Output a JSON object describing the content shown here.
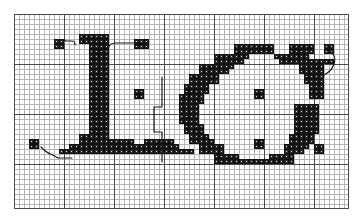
{
  "document": {
    "type": "cross-stitch-chart",
    "title": "Cross-stitch alphabet chart: L and G",
    "description": "Two-letter counted cross-stitch pattern chart on a squared grid with backstitch detail lines."
  },
  "grid": {
    "columns": 67,
    "rows": 39,
    "cell_size_px": 5,
    "bold_line_every": 10,
    "fine_line_color": "#b4b4b4",
    "bold_line_color": "#4a4a4a",
    "background_color": "#ffffff",
    "border_color": "#4a4a4a",
    "origin_x_px": 14,
    "origin_y_px": 14,
    "width_px": 335,
    "height_px": 195
  },
  "symbols": {
    "stitch": {
      "name": "full-cross-stitch",
      "fill_color": "#2b2b2b",
      "outline_color": "#111111",
      "center_dot_color": "#dcdcdc"
    },
    "backstitch": {
      "name": "backstitch-line",
      "stroke_color": "#1a1a1a",
      "stroke_width": 1.2
    }
  },
  "letters": [
    {
      "name": "letter-L",
      "character": "L",
      "position": "left"
    },
    {
      "name": "letter-G",
      "character": "G",
      "position": "right"
    }
  ],
  "chart_data": {
    "type": "heatmap",
    "xlabel": "",
    "ylabel": "",
    "grid": true,
    "legend": "none",
    "columns": 67,
    "rows": 39,
    "note": "Each entry is a filled cell given as [column, row], zero-indexed from the top-left of the charted field.",
    "stitches": [
      [
        8,
        5
      ],
      [
        9,
        5
      ],
      [
        8,
        6
      ],
      [
        9,
        6
      ],
      [
        13,
        4
      ],
      [
        14,
        4
      ],
      [
        15,
        4
      ],
      [
        16,
        4
      ],
      [
        17,
        4
      ],
      [
        18,
        4
      ],
      [
        13,
        5
      ],
      [
        14,
        5
      ],
      [
        15,
        5
      ],
      [
        16,
        5
      ],
      [
        17,
        5
      ],
      [
        18,
        5
      ],
      [
        15,
        6
      ],
      [
        16,
        6
      ],
      [
        17,
        6
      ],
      [
        18,
        6
      ],
      [
        24,
        5
      ],
      [
        25,
        5
      ],
      [
        26,
        5
      ],
      [
        24,
        6
      ],
      [
        25,
        6
      ],
      [
        26,
        6
      ],
      [
        15,
        7
      ],
      [
        16,
        7
      ],
      [
        17,
        7
      ],
      [
        18,
        7
      ],
      [
        15,
        8
      ],
      [
        16,
        8
      ],
      [
        17,
        8
      ],
      [
        18,
        8
      ],
      [
        15,
        9
      ],
      [
        16,
        9
      ],
      [
        17,
        9
      ],
      [
        18,
        9
      ],
      [
        15,
        10
      ],
      [
        16,
        10
      ],
      [
        17,
        10
      ],
      [
        18,
        10
      ],
      [
        15,
        11
      ],
      [
        16,
        11
      ],
      [
        17,
        11
      ],
      [
        18,
        11
      ],
      [
        15,
        12
      ],
      [
        16,
        12
      ],
      [
        17,
        12
      ],
      [
        18,
        12
      ],
      [
        15,
        13
      ],
      [
        16,
        13
      ],
      [
        17,
        13
      ],
      [
        18,
        13
      ],
      [
        15,
        14
      ],
      [
        16,
        14
      ],
      [
        17,
        14
      ],
      [
        18,
        14
      ],
      [
        15,
        15
      ],
      [
        16,
        15
      ],
      [
        17,
        15
      ],
      [
        18,
        15
      ],
      [
        15,
        16
      ],
      [
        16,
        16
      ],
      [
        17,
        16
      ],
      [
        18,
        16
      ],
      [
        15,
        17
      ],
      [
        16,
        17
      ],
      [
        17,
        17
      ],
      [
        18,
        17
      ],
      [
        15,
        18
      ],
      [
        16,
        18
      ],
      [
        17,
        18
      ],
      [
        18,
        18
      ],
      [
        15,
        19
      ],
      [
        16,
        19
      ],
      [
        17,
        19
      ],
      [
        18,
        19
      ],
      [
        15,
        20
      ],
      [
        16,
        20
      ],
      [
        17,
        20
      ],
      [
        18,
        20
      ],
      [
        15,
        21
      ],
      [
        16,
        21
      ],
      [
        17,
        21
      ],
      [
        18,
        21
      ],
      [
        15,
        22
      ],
      [
        16,
        22
      ],
      [
        17,
        22
      ],
      [
        18,
        22
      ],
      [
        15,
        23
      ],
      [
        16,
        23
      ],
      [
        17,
        23
      ],
      [
        18,
        23
      ],
      [
        24,
        15
      ],
      [
        25,
        15
      ],
      [
        24,
        16
      ],
      [
        25,
        16
      ],
      [
        13,
        24
      ],
      [
        14,
        24
      ],
      [
        15,
        24
      ],
      [
        16,
        24
      ],
      [
        17,
        24
      ],
      [
        18,
        24
      ],
      [
        13,
        25
      ],
      [
        14,
        25
      ],
      [
        15,
        25
      ],
      [
        16,
        25
      ],
      [
        17,
        25
      ],
      [
        18,
        25
      ],
      [
        19,
        25
      ],
      [
        20,
        25
      ],
      [
        21,
        25
      ],
      [
        22,
        25
      ],
      [
        23,
        25
      ],
      [
        11,
        26
      ],
      [
        12,
        26
      ],
      [
        13,
        26
      ],
      [
        14,
        26
      ],
      [
        15,
        26
      ],
      [
        16,
        26
      ],
      [
        17,
        26
      ],
      [
        18,
        26
      ],
      [
        19,
        26
      ],
      [
        20,
        26
      ],
      [
        21,
        26
      ],
      [
        22,
        26
      ],
      [
        23,
        26
      ],
      [
        24,
        26
      ],
      [
        25,
        26
      ],
      [
        26,
        25
      ],
      [
        27,
        25
      ],
      [
        28,
        25
      ],
      [
        29,
        25
      ],
      [
        30,
        25
      ],
      [
        31,
        25
      ],
      [
        26,
        26
      ],
      [
        27,
        26
      ],
      [
        28,
        26
      ],
      [
        29,
        26
      ],
      [
        30,
        26
      ],
      [
        31,
        26
      ],
      [
        32,
        26
      ],
      [
        9,
        27
      ],
      [
        10,
        27
      ],
      [
        11,
        27
      ],
      [
        12,
        27
      ],
      [
        13,
        27
      ],
      [
        14,
        27
      ],
      [
        15,
        27
      ],
      [
        16,
        27
      ],
      [
        17,
        27
      ],
      [
        18,
        27
      ],
      [
        19,
        27
      ],
      [
        20,
        27
      ],
      [
        21,
        27
      ],
      [
        22,
        27
      ],
      [
        23,
        27
      ],
      [
        24,
        27
      ],
      [
        25,
        27
      ],
      [
        26,
        27
      ],
      [
        27,
        27
      ],
      [
        28,
        27
      ],
      [
        29,
        27
      ],
      [
        30,
        27
      ],
      [
        31,
        27
      ],
      [
        32,
        27
      ],
      [
        33,
        27
      ],
      [
        34,
        27
      ],
      [
        35,
        27
      ],
      [
        3,
        25
      ],
      [
        4,
        25
      ],
      [
        3,
        26
      ],
      [
        4,
        26
      ],
      [
        39,
        26
      ],
      [
        40,
        26
      ],
      [
        39,
        27
      ],
      [
        40,
        27
      ],
      [
        44,
        6
      ],
      [
        45,
        6
      ],
      [
        46,
        6
      ],
      [
        47,
        6
      ],
      [
        48,
        6
      ],
      [
        49,
        6
      ],
      [
        50,
        6
      ],
      [
        51,
        6
      ],
      [
        44,
        7
      ],
      [
        45,
        7
      ],
      [
        46,
        7
      ],
      [
        47,
        7
      ],
      [
        48,
        7
      ],
      [
        49,
        7
      ],
      [
        50,
        7
      ],
      [
        51,
        7
      ],
      [
        55,
        6
      ],
      [
        56,
        6
      ],
      [
        57,
        6
      ],
      [
        58,
        6
      ],
      [
        59,
        6
      ],
      [
        55,
        7
      ],
      [
        56,
        7
      ],
      [
        57,
        7
      ],
      [
        58,
        7
      ],
      [
        59,
        7
      ],
      [
        62,
        6
      ],
      [
        63,
        6
      ],
      [
        62,
        7
      ],
      [
        63,
        7
      ],
      [
        40,
        8
      ],
      [
        41,
        8
      ],
      [
        42,
        8
      ],
      [
        43,
        8
      ],
      [
        44,
        8
      ],
      [
        45,
        8
      ],
      [
        46,
        8
      ],
      [
        40,
        9
      ],
      [
        41,
        9
      ],
      [
        42,
        9
      ],
      [
        43,
        9
      ],
      [
        44,
        9
      ],
      [
        45,
        9
      ],
      [
        52,
        8
      ],
      [
        53,
        8
      ],
      [
        54,
        8
      ],
      [
        55,
        8
      ],
      [
        56,
        8
      ],
      [
        57,
        8
      ],
      [
        58,
        8
      ],
      [
        53,
        9
      ],
      [
        54,
        9
      ],
      [
        55,
        9
      ],
      [
        56,
        9
      ],
      [
        57,
        9
      ],
      [
        58,
        9
      ],
      [
        59,
        9
      ],
      [
        60,
        9
      ],
      [
        61,
        9
      ],
      [
        62,
        9
      ],
      [
        63,
        9
      ],
      [
        37,
        10
      ],
      [
        38,
        10
      ],
      [
        39,
        10
      ],
      [
        40,
        10
      ],
      [
        41,
        10
      ],
      [
        42,
        10
      ],
      [
        43,
        10
      ],
      [
        37,
        11
      ],
      [
        38,
        11
      ],
      [
        39,
        11
      ],
      [
        40,
        11
      ],
      [
        41,
        11
      ],
      [
        42,
        11
      ],
      [
        57,
        10
      ],
      [
        58,
        10
      ],
      [
        59,
        10
      ],
      [
        60,
        10
      ],
      [
        61,
        10
      ],
      [
        57,
        11
      ],
      [
        58,
        11
      ],
      [
        59,
        11
      ],
      [
        60,
        11
      ],
      [
        61,
        11
      ],
      [
        35,
        12
      ],
      [
        36,
        12
      ],
      [
        37,
        12
      ],
      [
        38,
        12
      ],
      [
        39,
        12
      ],
      [
        40,
        12
      ],
      [
        35,
        13
      ],
      [
        36,
        13
      ],
      [
        37,
        13
      ],
      [
        38,
        13
      ],
      [
        39,
        13
      ],
      [
        40,
        13
      ],
      [
        58,
        12
      ],
      [
        59,
        12
      ],
      [
        60,
        12
      ],
      [
        61,
        12
      ],
      [
        58,
        13
      ],
      [
        59,
        13
      ],
      [
        60,
        13
      ],
      [
        61,
        13
      ],
      [
        34,
        14
      ],
      [
        35,
        14
      ],
      [
        36,
        14
      ],
      [
        37,
        14
      ],
      [
        38,
        14
      ],
      [
        34,
        15
      ],
      [
        35,
        15
      ],
      [
        36,
        15
      ],
      [
        37,
        15
      ],
      [
        38,
        15
      ],
      [
        59,
        14
      ],
      [
        60,
        14
      ],
      [
        61,
        14
      ],
      [
        59,
        15
      ],
      [
        60,
        15
      ],
      [
        61,
        15
      ],
      [
        33,
        16
      ],
      [
        34,
        16
      ],
      [
        35,
        16
      ],
      [
        36,
        16
      ],
      [
        37,
        16
      ],
      [
        33,
        17
      ],
      [
        34,
        17
      ],
      [
        35,
        17
      ],
      [
        36,
        17
      ],
      [
        37,
        17
      ],
      [
        59,
        16
      ],
      [
        60,
        16
      ],
      [
        61,
        16
      ],
      [
        48,
        15
      ],
      [
        49,
        15
      ],
      [
        48,
        16
      ],
      [
        49,
        16
      ],
      [
        33,
        18
      ],
      [
        34,
        18
      ],
      [
        35,
        18
      ],
      [
        36,
        18
      ],
      [
        33,
        19
      ],
      [
        34,
        19
      ],
      [
        35,
        19
      ],
      [
        36,
        19
      ],
      [
        33,
        20
      ],
      [
        34,
        20
      ],
      [
        35,
        20
      ],
      [
        36,
        20
      ],
      [
        33,
        21
      ],
      [
        34,
        21
      ],
      [
        35,
        21
      ],
      [
        36,
        21
      ],
      [
        56,
        18
      ],
      [
        57,
        18
      ],
      [
        58,
        18
      ],
      [
        59,
        18
      ],
      [
        60,
        18
      ],
      [
        56,
        19
      ],
      [
        57,
        19
      ],
      [
        58,
        19
      ],
      [
        59,
        19
      ],
      [
        60,
        19
      ],
      [
        56,
        20
      ],
      [
        57,
        20
      ],
      [
        58,
        20
      ],
      [
        59,
        20
      ],
      [
        60,
        20
      ],
      [
        56,
        21
      ],
      [
        57,
        21
      ],
      [
        58,
        21
      ],
      [
        59,
        21
      ],
      [
        60,
        21
      ],
      [
        34,
        22
      ],
      [
        35,
        22
      ],
      [
        36,
        22
      ],
      [
        37,
        22
      ],
      [
        34,
        23
      ],
      [
        35,
        23
      ],
      [
        36,
        23
      ],
      [
        37,
        23
      ],
      [
        56,
        22
      ],
      [
        57,
        22
      ],
      [
        58,
        22
      ],
      [
        59,
        22
      ],
      [
        60,
        22
      ],
      [
        56,
        23
      ],
      [
        57,
        23
      ],
      [
        58,
        23
      ],
      [
        59,
        23
      ],
      [
        60,
        23
      ],
      [
        48,
        25
      ],
      [
        49,
        25
      ],
      [
        48,
        26
      ],
      [
        49,
        26
      ],
      [
        35,
        24
      ],
      [
        36,
        24
      ],
      [
        37,
        24
      ],
      [
        38,
        24
      ],
      [
        35,
        25
      ],
      [
        36,
        25
      ],
      [
        37,
        25
      ],
      [
        38,
        25
      ],
      [
        39,
        25
      ],
      [
        55,
        24
      ],
      [
        56,
        24
      ],
      [
        57,
        24
      ],
      [
        58,
        24
      ],
      [
        59,
        24
      ],
      [
        55,
        25
      ],
      [
        56,
        25
      ],
      [
        57,
        25
      ],
      [
        58,
        25
      ],
      [
        59,
        25
      ],
      [
        37,
        26
      ],
      [
        38,
        26
      ],
      [
        39,
        26
      ],
      [
        40,
        26
      ],
      [
        41,
        26
      ],
      [
        37,
        27
      ],
      [
        38,
        27
      ],
      [
        39,
        27
      ],
      [
        40,
        27
      ],
      [
        41,
        27
      ],
      [
        54,
        26
      ],
      [
        55,
        26
      ],
      [
        56,
        26
      ],
      [
        57,
        26
      ],
      [
        58,
        26
      ],
      [
        54,
        27
      ],
      [
        55,
        27
      ],
      [
        56,
        27
      ],
      [
        57,
        27
      ],
      [
        60,
        26
      ],
      [
        61,
        26
      ],
      [
        60,
        27
      ],
      [
        61,
        27
      ],
      [
        40,
        28
      ],
      [
        41,
        28
      ],
      [
        42,
        28
      ],
      [
        43,
        28
      ],
      [
        44,
        28
      ],
      [
        40,
        29
      ],
      [
        41,
        29
      ],
      [
        42,
        29
      ],
      [
        43,
        29
      ],
      [
        44,
        29
      ],
      [
        45,
        29
      ],
      [
        46,
        29
      ],
      [
        47,
        29
      ],
      [
        48,
        29
      ],
      [
        49,
        29
      ],
      [
        50,
        29
      ],
      [
        51,
        29
      ],
      [
        52,
        29
      ],
      [
        53,
        29
      ],
      [
        54,
        29
      ],
      [
        55,
        29
      ],
      [
        51,
        28
      ],
      [
        52,
        28
      ],
      [
        53,
        28
      ],
      [
        54,
        28
      ],
      [
        55,
        28
      ]
    ],
    "backstitch_paths": [
      "M 45,29 C 47,25 50,25 52,27 L 58,27 C 60,27 61,29 61,31",
      "M 125,29 L 101,29 C 96,29 94,33 94,36",
      "M 27,133 C 33,140 38,140 44,144 L 58,144",
      "M 148,63 L 148,93 L 140,93 L 140,118 L 148,118 L 148,148",
      "M 313,36 C 320,38 322,44 320,50 C 318,56 314,59 310,61"
    ]
  }
}
